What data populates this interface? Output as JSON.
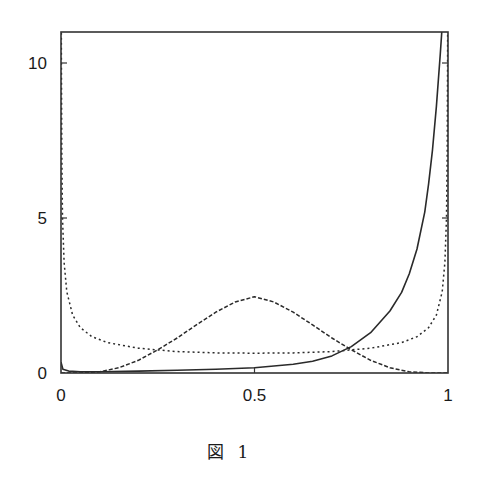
{
  "caption": "図 1",
  "chart_data": {
    "type": "line",
    "title": "",
    "xlabel": "",
    "ylabel": "",
    "xlim": [
      0,
      1
    ],
    "ylim": [
      0,
      11
    ],
    "grid": false,
    "legend": null,
    "x_ticks": [
      {
        "value": 0,
        "label": "0"
      },
      {
        "value": 0.5,
        "label": "0.5"
      },
      {
        "value": 1,
        "label": "1"
      }
    ],
    "y_ticks": [
      {
        "value": 0,
        "label": "0"
      },
      {
        "value": 5,
        "label": "5"
      },
      {
        "value": 10,
        "label": "10"
      }
    ],
    "series": [
      {
        "name": "solid",
        "style": "solid",
        "x": [
          0,
          0.005,
          0.02,
          0.05,
          0.1,
          0.2,
          0.3,
          0.4,
          0.5,
          0.6,
          0.65,
          0.7,
          0.75,
          0.8,
          0.85,
          0.88,
          0.9,
          0.92,
          0.94,
          0.95,
          0.96,
          0.97,
          0.98,
          0.985
        ],
        "values": [
          0.35,
          0.12,
          0.06,
          0.04,
          0.04,
          0.06,
          0.09,
          0.12,
          0.17,
          0.28,
          0.38,
          0.55,
          0.85,
          1.3,
          2.0,
          2.6,
          3.2,
          4.0,
          5.2,
          6.1,
          7.2,
          8.6,
          10.3,
          11.2
        ]
      },
      {
        "name": "dashed",
        "style": "dashed",
        "x": [
          0,
          0.05,
          0.1,
          0.15,
          0.2,
          0.25,
          0.3,
          0.35,
          0.4,
          0.45,
          0.5,
          0.55,
          0.6,
          0.65,
          0.7,
          0.75,
          0.8,
          0.85,
          0.9,
          0.95,
          1
        ],
        "values": [
          0,
          0.003,
          0.04,
          0.17,
          0.41,
          0.75,
          1.13,
          1.55,
          1.96,
          2.29,
          2.46,
          2.29,
          1.96,
          1.55,
          1.13,
          0.75,
          0.41,
          0.17,
          0.04,
          0.003,
          0
        ]
      },
      {
        "name": "dotted",
        "style": "dotted",
        "x": [
          0.0005,
          0.001,
          0.002,
          0.004,
          0.008,
          0.015,
          0.03,
          0.05,
          0.08,
          0.12,
          0.2,
          0.3,
          0.4,
          0.5,
          0.6,
          0.7,
          0.8,
          0.88,
          0.92,
          0.95,
          0.97,
          0.985,
          0.992,
          0.996,
          0.998,
          0.999,
          0.9995
        ],
        "values": [
          14.2,
          10.1,
          7.1,
          5.0,
          3.57,
          2.62,
          1.87,
          1.46,
          1.17,
          0.98,
          0.8,
          0.69,
          0.65,
          0.64,
          0.65,
          0.69,
          0.8,
          0.98,
          1.17,
          1.46,
          1.87,
          2.62,
          3.57,
          5.0,
          7.1,
          10.1,
          14.2
        ]
      }
    ]
  }
}
